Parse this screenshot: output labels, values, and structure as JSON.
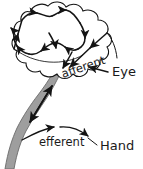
{
  "diagram": {
    "type": "schematic",
    "background_color": "#ffffff",
    "line_color": "#141414",
    "band_color": "#9e9e9e",
    "band_edge_color": "#6e6e6e",
    "labels": {
      "afferent": "afferent",
      "efferent": "efferent",
      "eye": "Eye",
      "hand": "Hand"
    },
    "label_positions": {
      "afferent": {
        "x": 63,
        "y": 78,
        "rotation": -19
      },
      "efferent": {
        "x": 39,
        "y": 143,
        "rotation": 0
      },
      "eye": {
        "x": 112,
        "y": 75,
        "rotation": 0
      },
      "hand": {
        "x": 100,
        "y": 146,
        "rotation": 0
      }
    },
    "elements": [
      {
        "name": "brain-cloud",
        "kind": "cloud-outline"
      },
      {
        "name": "internal-arrow-loop",
        "kind": "arrow-path",
        "arrow_count": 9
      },
      {
        "name": "afferent-pathway",
        "kind": "arrow-line",
        "direction": "eye-to-brain"
      },
      {
        "name": "efferent-pathway",
        "kind": "arrow-line",
        "direction": "brain-to-hand"
      },
      {
        "name": "arm-band",
        "kind": "filled-band"
      },
      {
        "name": "eye-leader",
        "kind": "leader-line"
      },
      {
        "name": "hand-leader",
        "kind": "leader-line"
      }
    ]
  }
}
